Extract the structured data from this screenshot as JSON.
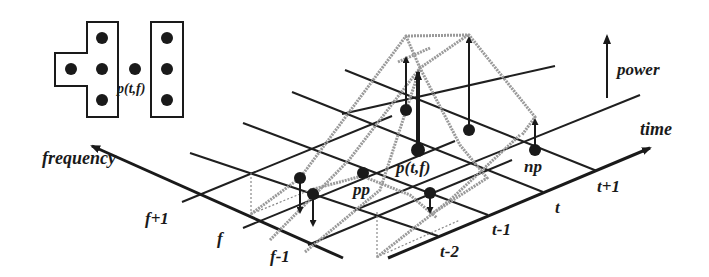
{
  "labels": {
    "power": "power",
    "time": "time",
    "frequency": "frequency",
    "freq_ticks": [
      "f+1",
      "f",
      "f-1"
    ],
    "time_ticks": [
      "t-2",
      "t-1",
      "t",
      "t+1"
    ],
    "point_center": "p(t,f)",
    "point_prev": "pp",
    "point_next": "np",
    "inset_center": "p(t,f)"
  },
  "legend": {
    "description": "Neighborhood inset: T-shaped region (4 points) and vertical bar region (3 points) around p(t,f)"
  },
  "colors": {
    "ink": "#1a1a1a",
    "surface": "#9a9a9a",
    "background": "#ffffff"
  }
}
